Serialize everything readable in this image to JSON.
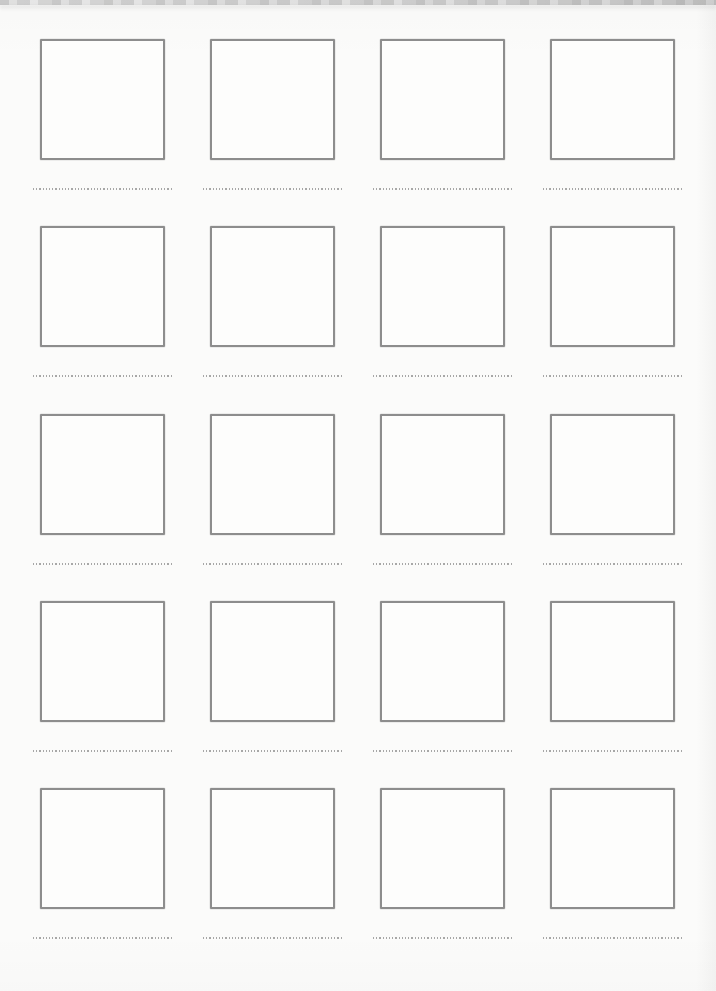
{
  "grid": {
    "rows": 5,
    "columns": 4,
    "total_frames": 20
  },
  "colors": {
    "page_background": "#fbfbfa",
    "frame_border": "#8d8d8d",
    "frame_fill": "#fdfdfc",
    "caption_dotted_line": "#989898",
    "scan_edge_band": "#c9c9c9"
  }
}
